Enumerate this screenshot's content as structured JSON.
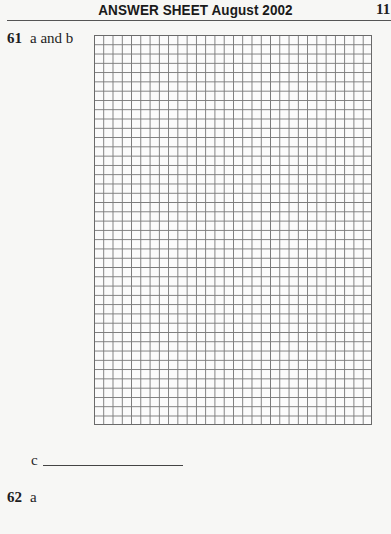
{
  "header": {
    "title": "ANSWER SHEET August 2002",
    "page_number": "11"
  },
  "questions": [
    {
      "number": "61",
      "parts_label": "a and b",
      "grid": {
        "columns": 30,
        "rows": 42
      },
      "part_c": {
        "label": "c",
        "answer": ""
      }
    },
    {
      "number": "62",
      "parts_label": "a"
    }
  ]
}
